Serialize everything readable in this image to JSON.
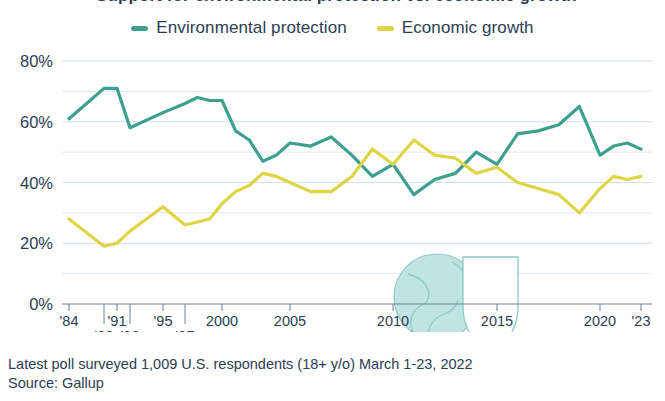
{
  "title_partial": "Support for environmental protection vs. economic growth",
  "legend": {
    "items": [
      {
        "label": "Environmental protection",
        "color": "#3da08f",
        "icon": "legend-line-swatch"
      },
      {
        "label": "Economic growth",
        "color": "#dfd446",
        "icon": "legend-line-swatch"
      }
    ]
  },
  "watermark": {
    "icon": "globe-shield-icon",
    "globe_color": "#bfe4e2",
    "outline_color": "#8fc7c4"
  },
  "footer": {
    "line1": "Latest poll surveyed 1,009 U.S. respondents (18+ y/o) March 1-23, 2022",
    "line2": "Source: Gallup"
  },
  "chart_data": {
    "type": "line",
    "title": "Support for environmental protection vs. economic growth",
    "xlabel": "",
    "ylabel": "",
    "ylim": [
      0,
      80
    ],
    "yticks": [
      0,
      20,
      40,
      60,
      80
    ],
    "ytick_labels": [
      "0%",
      "20%",
      "40%",
      "60%",
      "80%"
    ],
    "minor_gridlines": [
      10,
      30,
      50,
      70
    ],
    "grid": true,
    "legend_position": "top-center",
    "xtick_labels_row1": [
      "'84",
      "'91",
      "'95",
      "2000",
      "2005",
      "2010",
      "2015",
      "2020",
      "'23"
    ],
    "xtick_labels_row2": [
      "'90",
      "'92",
      "'97"
    ],
    "x": [
      1984,
      1990,
      1991,
      1992,
      1995,
      1997,
      1998,
      1999,
      2000,
      2001,
      2002,
      2003,
      2004,
      2005,
      2006,
      2007,
      2008,
      2009,
      2010,
      2011,
      2012,
      2013,
      2014,
      2015,
      2016,
      2017,
      2018,
      2019,
      2020,
      2021,
      2022,
      2023
    ],
    "series": [
      {
        "name": "Environmental protection",
        "color": "#3da08f",
        "values": [
          61,
          71,
          71,
          58,
          63,
          66,
          68,
          67,
          67,
          57,
          54,
          47,
          49,
          53,
          52,
          55,
          49,
          42,
          46,
          36,
          41,
          43,
          50,
          46,
          56,
          57,
          59,
          65,
          49,
          52,
          53,
          51
        ]
      },
      {
        "name": "Economic growth",
        "color": "#dfd446",
        "values": [
          28,
          19,
          20,
          24,
          32,
          26,
          27,
          28,
          33,
          37,
          39,
          43,
          42,
          40,
          37,
          37,
          42,
          51,
          46,
          54,
          49,
          48,
          43,
          45,
          40,
          38,
          36,
          30,
          38,
          42,
          41,
          42
        ]
      }
    ]
  }
}
